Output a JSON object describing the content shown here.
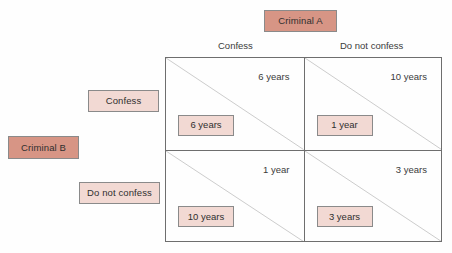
{
  "diagram": {
    "type": "payoff-matrix",
    "column_player": {
      "name": "Criminal A",
      "strategies": [
        "Confess",
        "Do not confess"
      ]
    },
    "row_player": {
      "name": "Criminal B",
      "strategies": [
        "Confess",
        "Do not confess"
      ]
    },
    "colors": {
      "player_tag": "#d79585",
      "strategy_tag": "#f2d9d3",
      "payoff_box": "#f2d9d3",
      "border": "#8a8a8a",
      "matrix_line": "#6e6e6e",
      "text": "#3b3b3b",
      "background": "#ffffff"
    },
    "cells": [
      {
        "id": "confess-confess",
        "row_strategy": "Confess",
        "column_strategy": "Confess",
        "column_payoff": "6 years",
        "row_payoff": "6 years"
      },
      {
        "id": "confess-do-not-confess",
        "row_strategy": "Confess",
        "column_strategy": "Do not confess",
        "column_payoff": "10 years",
        "row_payoff": "1 year"
      },
      {
        "id": "do-not-confess-confess",
        "row_strategy": "Do not confess",
        "column_strategy": "Confess",
        "column_payoff": "1 year",
        "row_payoff": "10 years"
      },
      {
        "id": "do-not-confess-do-not-confess",
        "row_strategy": "Do not confess",
        "column_strategy": "Do not confess",
        "column_payoff": "3 years",
        "row_payoff": "3 years"
      }
    ]
  }
}
